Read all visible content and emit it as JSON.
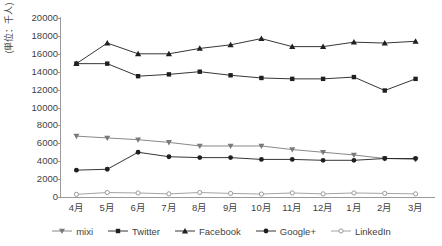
{
  "chart_data": {
    "type": "line",
    "title": "",
    "subtitle": "",
    "xlabel": "",
    "ylabel": "(単位：千人)",
    "categories": [
      "4月",
      "5月",
      "6月",
      "7月",
      "8月",
      "9月",
      "10月",
      "11月",
      "12月",
      "1月",
      "2月",
      "3月"
    ],
    "ylim": [
      0,
      20000
    ],
    "ytick_step": 2000,
    "yticks": [
      "20000",
      "18000",
      "16000",
      "14000",
      "12000",
      "10000",
      "8000",
      "6000",
      "4000",
      "2000",
      "0"
    ],
    "ytick_values": [
      20000,
      18000,
      16000,
      14000,
      12000,
      10000,
      8000,
      6000,
      4000,
      2000,
      0
    ],
    "grid": false,
    "legend_position": "bottom",
    "series": [
      {
        "name": "mixi",
        "marker": "triangle-down",
        "color": "#7a7a7a",
        "values": [
          6800,
          6600,
          6400,
          6100,
          5700,
          5700,
          5700,
          5300,
          5000,
          4700,
          4300,
          4200
        ]
      },
      {
        "name": "Twitter",
        "marker": "square",
        "color": "#1f1f1f",
        "values": [
          14900,
          14900,
          13500,
          13700,
          14000,
          13600,
          13300,
          13200,
          13200,
          13400,
          11900,
          13200
        ]
      },
      {
        "name": "Facebook",
        "marker": "triangle-up",
        "color": "#1f1f1f",
        "values": [
          14900,
          17200,
          16000,
          16000,
          16600,
          17000,
          17700,
          16800,
          16800,
          17300,
          17200,
          17400
        ]
      },
      {
        "name": "Google+",
        "marker": "circle-filled",
        "color": "#1f1f1f",
        "values": [
          3000,
          3100,
          5000,
          4500,
          4400,
          4400,
          4200,
          4200,
          4100,
          4100,
          4300,
          4300
        ]
      },
      {
        "name": "LinkedIn",
        "marker": "circle-open",
        "color": "#9a9a9a",
        "values": [
          300,
          500,
          450,
          350,
          500,
          400,
          330,
          450,
          350,
          450,
          400,
          350
        ]
      }
    ]
  }
}
